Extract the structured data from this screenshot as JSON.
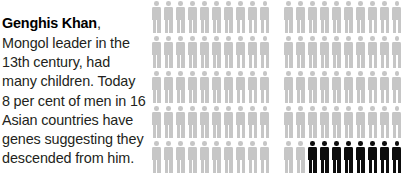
{
  "caption": {
    "lead": "Genghis Khan",
    "body": ", Mongol leader in the 13th century, had many children. Today 8 per cent of men in 16 Asian countries have genes suggesting they descended from him."
  },
  "colors": {
    "figure_light": "#c6c6c6",
    "figure_dark": "#0d0d0d",
    "text": "#231f20",
    "background": "#ffffff"
  },
  "chart_data": {
    "type": "pictogram",
    "title": "Genghis Khan",
    "unit_label": "1 figure = 1 per cent of men",
    "total_units": 100,
    "highlighted_units": 8,
    "highlighted_percent": 8,
    "legend": [
      {
        "label": "men with genes suggesting descent from Genghis Khan",
        "color": "#0d0d0d",
        "count": 8
      },
      {
        "label": "other men",
        "color": "#c6c6c6",
        "count": 92
      }
    ],
    "layout": {
      "blocks": 2,
      "columns_per_block": 10,
      "rows_per_block": 5,
      "figures_per_block": 50,
      "fill_order": "bottom-right"
    },
    "blocks": [
      {
        "name": "left-block",
        "rows": [
          [
            "light",
            "light",
            "light",
            "light",
            "light",
            "light",
            "light",
            "light",
            "light",
            "light"
          ],
          [
            "light",
            "light",
            "light",
            "light",
            "light",
            "light",
            "light",
            "light",
            "light",
            "light"
          ],
          [
            "light",
            "light",
            "light",
            "light",
            "light",
            "light",
            "light",
            "light",
            "light",
            "light"
          ],
          [
            "light",
            "light",
            "light",
            "light",
            "light",
            "light",
            "light",
            "light",
            "light",
            "light"
          ],
          [
            "light",
            "light",
            "light",
            "light",
            "light",
            "light",
            "light",
            "light",
            "light",
            "light"
          ]
        ]
      },
      {
        "name": "right-block",
        "rows": [
          [
            "light",
            "light",
            "light",
            "light",
            "light",
            "light",
            "light",
            "light",
            "light",
            "light"
          ],
          [
            "light",
            "light",
            "light",
            "light",
            "light",
            "light",
            "light",
            "light",
            "light",
            "light"
          ],
          [
            "light",
            "light",
            "light",
            "light",
            "light",
            "light",
            "light",
            "light",
            "light",
            "light"
          ],
          [
            "light",
            "light",
            "light",
            "light",
            "light",
            "light",
            "light",
            "light",
            "light",
            "light"
          ],
          [
            "light",
            "light",
            "dark",
            "dark",
            "dark",
            "dark",
            "dark",
            "dark",
            "dark",
            "dark"
          ]
        ]
      }
    ]
  }
}
